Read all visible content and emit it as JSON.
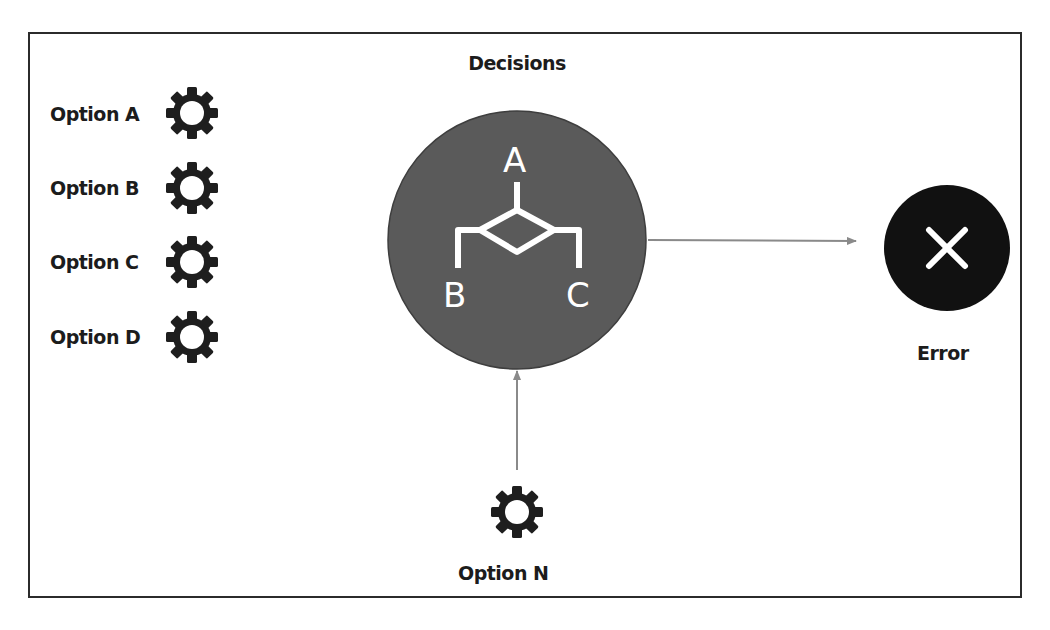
{
  "diagram": {
    "title": "Decisions",
    "options": [
      {
        "label": "Option A",
        "icon": "gear-icon"
      },
      {
        "label": "Option B",
        "icon": "gear-icon"
      },
      {
        "label": "Option C",
        "icon": "gear-icon"
      },
      {
        "label": "Option D",
        "icon": "gear-icon"
      }
    ],
    "decision_node": {
      "icon": "decision-branch-icon",
      "branches": [
        "A",
        "B",
        "C"
      ],
      "color": "#5a5a5a"
    },
    "error_node": {
      "label": "Error",
      "icon": "close-x-icon",
      "color": "#111111"
    },
    "extra_option": {
      "label": "Option N",
      "icon": "gear-icon"
    },
    "connector_color": "#8a8a8a"
  }
}
